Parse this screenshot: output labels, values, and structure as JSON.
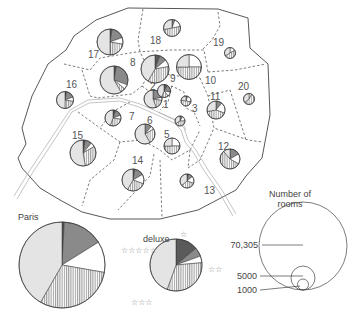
{
  "map": {
    "title": "Hotel rooms in Paris by arrondissement and category",
    "colors": {
      "deluxe": "#5a5a5a",
      "four_star": "#8a8a8a",
      "three_star": "#e4e4e4",
      "two_star": "#ffffff",
      "one_star": "#ffffff",
      "outline": "#333333",
      "boundary_dash": "#444444",
      "river": "#bbbbbb"
    },
    "arrondissements": [
      {
        "id": "1",
        "label": "1",
        "lx": 163,
        "ly": 108,
        "pie": {
          "cx": 153,
          "cy": 99,
          "r": 9
        }
      },
      {
        "id": "2",
        "label": "2",
        "lx": 150,
        "ly": 90,
        "pie": {
          "cx": 164,
          "cy": 91,
          "r": 6.5
        }
      },
      {
        "id": "3",
        "label": "3",
        "lx": 192,
        "ly": 112,
        "pie": {
          "cx": 186,
          "cy": 101,
          "r": 5
        }
      },
      {
        "id": "4",
        "label": "",
        "lx": 0,
        "ly": 0,
        "pie": {
          "cx": 180,
          "cy": 121,
          "r": 5
        }
      },
      {
        "id": "5",
        "label": "5",
        "lx": 164,
        "ly": 138,
        "pie": {
          "cx": 172,
          "cy": 146,
          "r": 8
        }
      },
      {
        "id": "6",
        "label": "6",
        "lx": 147,
        "ly": 124,
        "pie": {
          "cx": 145,
          "cy": 134,
          "r": 10
        }
      },
      {
        "id": "7",
        "label": "7",
        "lx": 129,
        "ly": 120,
        "pie": {
          "cx": 113,
          "cy": 118,
          "r": 8
        }
      },
      {
        "id": "8",
        "label": "8",
        "lx": 130,
        "ly": 66,
        "pie": {
          "cx": 114,
          "cy": 80,
          "r": 14
        }
      },
      {
        "id": "9",
        "label": "9",
        "lx": 170,
        "ly": 82,
        "pie": {
          "cx": 155,
          "cy": 69,
          "r": 14
        }
      },
      {
        "id": "10",
        "label": "10",
        "lx": 205,
        "ly": 84,
        "pie": {
          "cx": 189,
          "cy": 67,
          "r": 12.5
        }
      },
      {
        "id": "11",
        "label": "11",
        "lx": 210,
        "ly": 100,
        "pie": {
          "cx": 216,
          "cy": 110,
          "r": 9
        }
      },
      {
        "id": "12",
        "label": "12",
        "lx": 218,
        "ly": 150,
        "pie": {
          "cx": 230,
          "cy": 159,
          "r": 10
        }
      },
      {
        "id": "13",
        "label": "13",
        "lx": 204,
        "ly": 194,
        "pie": {
          "cx": 187,
          "cy": 181,
          "r": 7
        }
      },
      {
        "id": "14",
        "label": "14",
        "lx": 132,
        "ly": 164,
        "pie": {
          "cx": 133,
          "cy": 180,
          "r": 11
        }
      },
      {
        "id": "15",
        "label": "15",
        "lx": 72,
        "ly": 139,
        "pie": {
          "cx": 83,
          "cy": 153,
          "r": 13
        }
      },
      {
        "id": "16",
        "label": "16",
        "lx": 66,
        "ly": 88,
        "pie": {
          "cx": 65,
          "cy": 100,
          "r": 8.5
        }
      },
      {
        "id": "17",
        "label": "17",
        "lx": 88,
        "ly": 58,
        "pie": {
          "cx": 110,
          "cy": 42,
          "r": 13
        }
      },
      {
        "id": "18",
        "label": "18",
        "lx": 150,
        "ly": 44,
        "pie": {
          "cx": 172,
          "cy": 28,
          "r": 8.5
        }
      },
      {
        "id": "19",
        "label": "19",
        "lx": 213,
        "ly": 46,
        "pie": {
          "cx": 230,
          "cy": 53,
          "r": 5.5
        }
      },
      {
        "id": "20",
        "label": "20",
        "lx": 238,
        "ly": 90,
        "pie": {
          "cx": 249,
          "cy": 99,
          "r": 5.5
        }
      }
    ]
  },
  "summary_pie": {
    "label": "Paris",
    "cx": 62,
    "cy": 265,
    "r": 43
  },
  "category_legend": {
    "deluxe_label": "deluxe",
    "five_star_label": "☆☆☆☆☆",
    "four_star_label": "",
    "three_star_label": "☆☆☆",
    "two_star_label": "☆☆",
    "one_star_label": "☆",
    "cx": 176,
    "cy": 265,
    "r": 26
  },
  "size_legend": {
    "title_line1": "Number of",
    "title_line2": "rooms",
    "values": [
      {
        "label": "70,305",
        "r": 44
      },
      {
        "label": "5000",
        "r": 12
      },
      {
        "label": "1000",
        "r": 5.5
      }
    ]
  }
}
